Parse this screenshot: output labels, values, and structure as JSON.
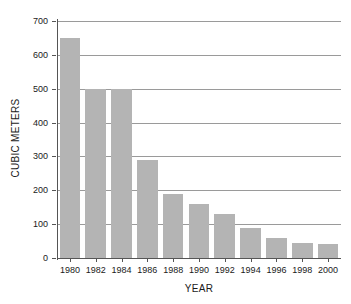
{
  "chart_data": {
    "type": "bar",
    "title": "",
    "xlabel": "YEAR",
    "ylabel": "CUBIC METERS",
    "categories": [
      "1980",
      "1982",
      "1984",
      "1986",
      "1988",
      "1990",
      "1992",
      "1994",
      "1996",
      "1998",
      "2000"
    ],
    "values": [
      650,
      500,
      500,
      290,
      190,
      160,
      130,
      90,
      60,
      45,
      40
    ],
    "ylim": [
      0,
      700
    ],
    "yticks": [
      0,
      100,
      200,
      300,
      400,
      500,
      600,
      700
    ],
    "ytick_labels": [
      "0",
      "100",
      "200",
      "300",
      "400",
      "500",
      "600",
      "700"
    ],
    "grid": true,
    "grid_axis": "y",
    "legend": "none",
    "bar_color": "#b4b4b4",
    "axis_color": "#555555",
    "gridline_color": "#9a9a9a",
    "background": "#ffffff"
  }
}
